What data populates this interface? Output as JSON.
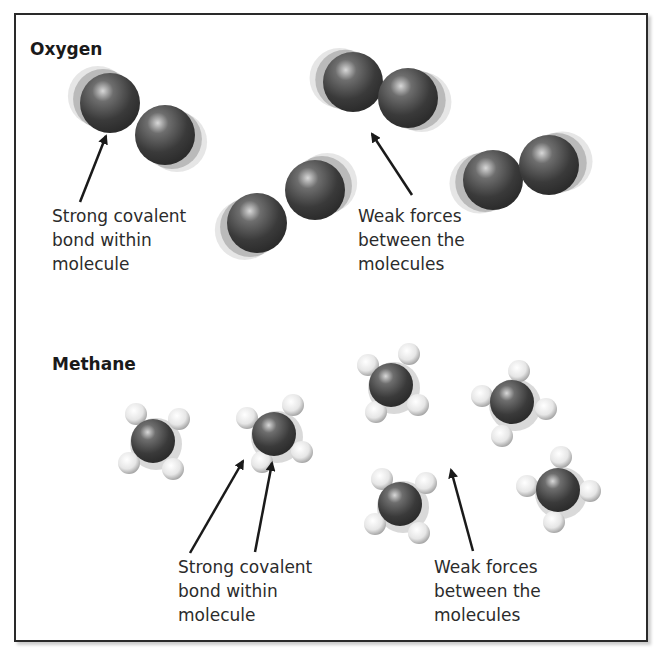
{
  "sections": {
    "oxygen": {
      "title": "Oxygen",
      "label_strong": [
        "Strong covalent",
        "bond within",
        "molecule"
      ],
      "label_weak": [
        "Weak forces",
        "between the",
        "molecules"
      ],
      "molecules": [
        {
          "a": [
            110,
            103
          ],
          "b": [
            165,
            135
          ]
        },
        {
          "a": [
            353,
            82
          ],
          "b": [
            408,
            98
          ]
        },
        {
          "a": [
            257,
            223
          ],
          "b": [
            315,
            190
          ]
        },
        {
          "a": [
            493,
            180
          ],
          "b": [
            549,
            165
          ]
        }
      ]
    },
    "methane": {
      "title": "Methane",
      "label_strong": [
        "Strong covalent",
        "bond within",
        "molecule"
      ],
      "label_weak": [
        "Weak forces",
        "between the",
        "molecules"
      ],
      "molecules": [
        {
          "c": [
            153,
            441
          ],
          "h": [
            [
              136,
              414
            ],
            [
              179,
              419
            ],
            [
              129,
              463
            ],
            [
              173,
              469
            ]
          ]
        },
        {
          "c": [
            274,
            434
          ],
          "h": [
            [
              247,
              418
            ],
            [
              293,
              405
            ],
            [
              302,
              452
            ],
            [
              262,
              462
            ]
          ]
        },
        {
          "c": [
            391,
            385
          ],
          "h": [
            [
              368,
              365
            ],
            [
              409,
              354
            ],
            [
              418,
              405
            ],
            [
              376,
              412
            ]
          ]
        },
        {
          "c": [
            512,
            402
          ],
          "h": [
            [
              482,
              396
            ],
            [
              519,
              371
            ],
            [
              546,
              409
            ],
            [
              502,
              436
            ]
          ]
        },
        {
          "c": [
            400,
            504
          ],
          "h": [
            [
              382,
              479
            ],
            [
              426,
              483
            ],
            [
              375,
              524
            ],
            [
              419,
              533
            ]
          ]
        },
        {
          "c": [
            558,
            490
          ],
          "h": [
            [
              561,
              457
            ],
            [
              527,
              486
            ],
            [
              590,
              491
            ],
            [
              554,
              522
            ]
          ]
        }
      ]
    }
  },
  "colors": {
    "atom_dark": "#3c3c3c",
    "atom_light": "#e8e8e8",
    "border": "#2a2a2a"
  }
}
